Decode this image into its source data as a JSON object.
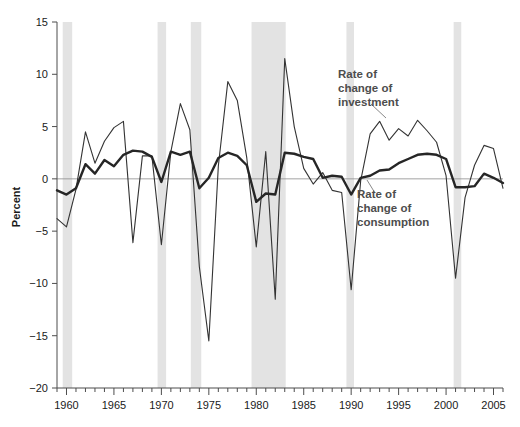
{
  "chart_data": {
    "type": "line",
    "title": "",
    "xlabel": "",
    "ylabel": "Percent",
    "xlim": [
      1959,
      2006
    ],
    "ylim": [
      -20,
      15
    ],
    "grid": false,
    "legend_position": "inline-annotations",
    "y_ticks": [
      15,
      10,
      5,
      0,
      -5,
      -10,
      -15,
      -20
    ],
    "y_tick_labels": [
      "15",
      "10",
      "5",
      "0",
      "−5",
      "−10",
      "−15",
      "−20"
    ],
    "x_ticks": [
      1959,
      1960,
      1961,
      1962,
      1963,
      1964,
      1965,
      1966,
      1967,
      1968,
      1969,
      1970,
      1971,
      1972,
      1973,
      1974,
      1975,
      1976,
      1977,
      1978,
      1979,
      1980,
      1981,
      1982,
      1983,
      1984,
      1985,
      1986,
      1987,
      1988,
      1989,
      1990,
      1991,
      1992,
      1993,
      1994,
      1995,
      1996,
      1997,
      1998,
      1999,
      2000,
      2001,
      2002,
      2003,
      2004,
      2005,
      2006
    ],
    "x_tick_labels_major": [
      "1960",
      "1965",
      "1970",
      "1975",
      "1980",
      "1985",
      "1990",
      "1995",
      "2000",
      "2005"
    ],
    "x_major_ticks": [
      1960,
      1965,
      1970,
      1975,
      1980,
      1985,
      1990,
      1995,
      2000,
      2005
    ],
    "zero_line": 0,
    "series": [
      {
        "name": "Rate of change of investment",
        "style": "thin",
        "color": "#333333",
        "x": [
          1959,
          1960,
          1961,
          1962,
          1963,
          1964,
          1965,
          1966,
          1967,
          1968,
          1969,
          1970,
          1971,
          1972,
          1973,
          1974,
          1975,
          1976,
          1977,
          1978,
          1979,
          1980,
          1981,
          1982,
          1983,
          1984,
          1985,
          1986,
          1987,
          1988,
          1989,
          1990,
          1991,
          1992,
          1993,
          1994,
          1995,
          1996,
          1997,
          1998,
          1999,
          2000,
          2001,
          2002,
          2003,
          2004,
          2005,
          2006
        ],
        "values": [
          -3.8,
          -4.6,
          -1.0,
          4.5,
          1.5,
          3.6,
          4.9,
          5.5,
          -6.1,
          2.2,
          2.2,
          -6.3,
          2.6,
          7.2,
          4.7,
          -8.4,
          -15.5,
          1.2,
          9.3,
          7.5,
          2.0,
          -6.5,
          2.6,
          -11.5,
          11.5,
          5.0,
          1.0,
          -0.5,
          0.6,
          -1.1,
          -1.3,
          -10.6,
          -0.2,
          4.3,
          5.5,
          3.7,
          4.8,
          4.1,
          5.6,
          4.6,
          3.5,
          0.3,
          -9.5,
          -1.8,
          1.3,
          3.2,
          2.9,
          -0.9
        ]
      },
      {
        "name": "Rate of change of consumption",
        "style": "thick",
        "color": "#262626",
        "x": [
          1959,
          1960,
          1961,
          1962,
          1963,
          1964,
          1965,
          1966,
          1967,
          1968,
          1969,
          1970,
          1971,
          1972,
          1973,
          1974,
          1975,
          1976,
          1977,
          1978,
          1979,
          1980,
          1981,
          1982,
          1983,
          1984,
          1985,
          1986,
          1987,
          1988,
          1989,
          1990,
          1991,
          1992,
          1993,
          1994,
          1995,
          1996,
          1997,
          1998,
          1999,
          2000,
          2001,
          2002,
          2003,
          2004,
          2005,
          2006
        ],
        "values": [
          -1.1,
          -1.5,
          -0.9,
          1.4,
          0.5,
          1.8,
          1.2,
          2.3,
          2.7,
          2.6,
          2.1,
          -0.3,
          2.6,
          2.3,
          2.6,
          -0.9,
          0.1,
          2.0,
          2.5,
          2.2,
          1.3,
          -2.2,
          -1.4,
          -1.5,
          2.5,
          2.4,
          2.1,
          1.9,
          0.1,
          0.3,
          0.2,
          -1.5,
          0.1,
          0.3,
          0.8,
          0.9,
          1.5,
          1.9,
          2.3,
          2.4,
          2.3,
          1.9,
          -0.8,
          -0.8,
          -0.7,
          0.5,
          0.1,
          -0.4
        ]
      }
    ],
    "recession_bands": [
      {
        "start": 1959.6,
        "end": 1960.6
      },
      {
        "start": 1969.6,
        "end": 1970.5
      },
      {
        "start": 1973.1,
        "end": 1974.2
      },
      {
        "start": 1979.5,
        "end": 1983.1
      },
      {
        "start": 1989.5,
        "end": 1990.3
      },
      {
        "start": 2000.8,
        "end": 2001.6
      }
    ],
    "band_color": "#e3e3e3",
    "annotations": [
      {
        "name": "investment-label",
        "lines": [
          "Rate of",
          "change of",
          "investment"
        ],
        "text_x": 338,
        "text_y": 78,
        "leader": {
          "x1": 371,
          "y1": 104,
          "x2": 386,
          "y2": 118
        }
      },
      {
        "name": "consumption-label",
        "lines": [
          "Rate of",
          "change of",
          "consumption"
        ],
        "text_x": 357,
        "text_y": 198,
        "leader": {
          "x1": 375,
          "y1": 193,
          "x2": 367,
          "y2": 180
        }
      }
    ]
  }
}
